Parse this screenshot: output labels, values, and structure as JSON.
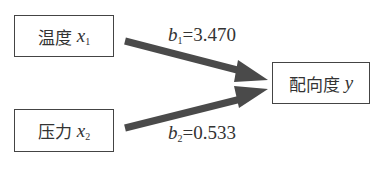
{
  "nodes": {
    "x1": {
      "label": "温度",
      "var": "x",
      "sub": "1"
    },
    "x2": {
      "label": "压力",
      "var": "x",
      "sub": "2"
    },
    "y": {
      "label": "配向度",
      "var": "y"
    }
  },
  "edges": [
    {
      "from": "x1",
      "to": "y",
      "coef_var": "b",
      "coef_sub": "1",
      "eq": "=3.470"
    },
    {
      "from": "x2",
      "to": "y",
      "coef_var": "b",
      "coef_sub": "2",
      "eq": "=0.533"
    }
  ],
  "colors": {
    "arrow": "#4a4a4a",
    "border": "#444444",
    "text": "#333333"
  }
}
